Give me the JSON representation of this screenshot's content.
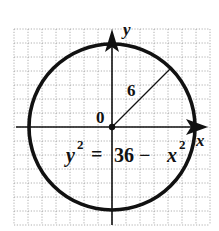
{
  "diagram": {
    "type": "circle-on-grid",
    "axes": {
      "x_label": "x",
      "y_label": "y",
      "origin_label": "0"
    },
    "circle": {
      "center": [
        0,
        0
      ],
      "radius": 6,
      "radius_label": "6"
    },
    "equation": {
      "lhs": "y",
      "lhs_exp": "2",
      "equals": "=",
      "rhs_const": "36 − ",
      "rhs_var": "x",
      "rhs_exp": "2"
    },
    "grid": {
      "x_range": [
        -7,
        7
      ],
      "y_range": [
        -7,
        7
      ],
      "step": 1
    },
    "colors": {
      "curve": "#111111",
      "axes": "#111111",
      "grid": "#9a9a9a",
      "background": "#ffffff"
    }
  }
}
